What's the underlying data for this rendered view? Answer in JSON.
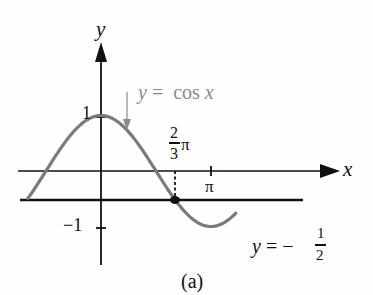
{
  "chart_data": {
    "type": "line",
    "title": "",
    "caption": "(a)",
    "xlabel": "x",
    "ylabel": "y",
    "series": [
      {
        "name": "y = cos x",
        "function": "cos(x)",
        "color": "#7a7a7a",
        "x_range": [
          -2.09,
          3.85
        ],
        "points": [
          {
            "x": -2.09,
            "y": -0.5
          },
          {
            "x": -1.5708,
            "y": 0
          },
          {
            "x": 0,
            "y": 1
          },
          {
            "x": 1.5708,
            "y": 0
          },
          {
            "x": 2.0944,
            "y": -0.5
          },
          {
            "x": 3.1416,
            "y": -1
          },
          {
            "x": 4.1888,
            "y": -0.5
          },
          {
            "x": 4.7124,
            "y": 0
          },
          {
            "x": 6.0,
            "y": 0.96
          }
        ]
      },
      {
        "name": "y = -1/2",
        "function": "-0.5",
        "color": "#111111",
        "x_range": [
          -2.09,
          5.95
        ],
        "points": [
          {
            "x": -2.09,
            "y": -0.5
          },
          {
            "x": 5.95,
            "y": -0.5
          }
        ]
      }
    ],
    "highlighted_point": {
      "x": 2.0944,
      "y": -0.5,
      "label": "2/3 π"
    },
    "x_ticks": [
      {
        "value": 2.0944,
        "label": "2/3 π"
      },
      {
        "value": 3.1416,
        "label": "π"
      }
    ],
    "y_ticks": [
      {
        "value": 1,
        "label": "1"
      },
      {
        "value": -1,
        "label": "−1"
      }
    ],
    "annotations": [
      {
        "text": "y = cos x",
        "target": "cos curve",
        "arrow": true
      },
      {
        "text": "y = −1/2",
        "target": "horizontal line"
      }
    ],
    "grid": false,
    "legend": "none"
  },
  "labels": {
    "y_axis": "y",
    "x_axis": "x",
    "y_one": "1",
    "y_minus_one": "−1",
    "cos_eq_y": "y",
    "cos_eq_rest": " =  cos ",
    "cos_eq_x": "x",
    "frac_num": "2",
    "frac_den": "3",
    "pi_after_frac": "π",
    "pi_tick": "π",
    "line_eq_y": "y",
    "line_eq_eq": " = −",
    "line_frac_num": "1",
    "line_frac_den": "2",
    "caption": "(a)"
  },
  "colors": {
    "axis": "#111111",
    "curve": "#7a7a7a",
    "annotation": "#8a8a8a",
    "point": "#111111"
  }
}
